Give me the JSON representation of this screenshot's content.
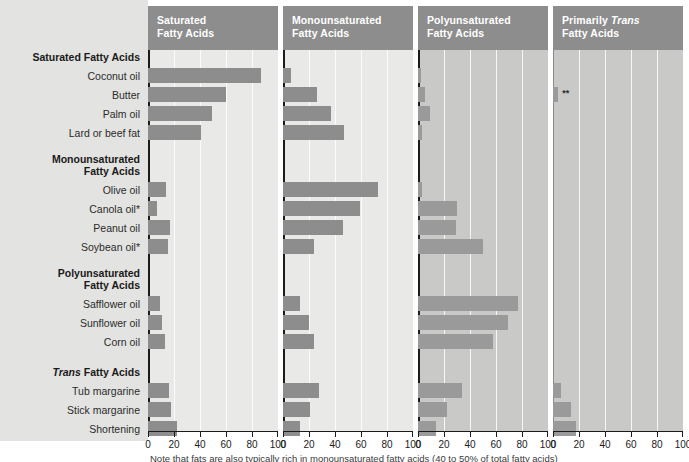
{
  "footnote": "Note that fats are also typically rich in monounsaturated fatty acids (40 to 50% of total fatty acids)",
  "axis": {
    "ticks": [
      0,
      20,
      40,
      60,
      80,
      100
    ],
    "min": 0,
    "max": 100
  },
  "panels": [
    {
      "id": "saturated",
      "line1": "Saturated",
      "line2": "Fatty Acids",
      "italic_word": ""
    },
    {
      "id": "monounsaturated",
      "line1": "Monounsaturated",
      "line2": "Fatty Acids",
      "italic_word": ""
    },
    {
      "id": "polyunsaturated",
      "line1": "Polyunsaturated",
      "line2": "Fatty Acids",
      "italic_word": ""
    },
    {
      "id": "trans",
      "line1": "Primarily ",
      "line2": "Fatty Acids",
      "italic_word": "Trans"
    }
  ],
  "rows": [
    {
      "label": "Saturated Fatty Acids",
      "type": "group",
      "italic": ""
    },
    {
      "label": "Coconut oil",
      "type": "item"
    },
    {
      "label": "Butter",
      "type": "item"
    },
    {
      "label": "Palm oil",
      "type": "item"
    },
    {
      "label": "Lard or beef fat",
      "type": "item"
    },
    {
      "label": "Monounsaturated",
      "type": "group-l1"
    },
    {
      "label": "Fatty Acids",
      "type": "group-l2"
    },
    {
      "label": "Olive oil",
      "type": "item"
    },
    {
      "label": "Canola oil*",
      "type": "item"
    },
    {
      "label": "Peanut oil",
      "type": "item"
    },
    {
      "label": "Soybean oil*",
      "type": "item"
    },
    {
      "label": "Polyunsaturated",
      "type": "group-l1"
    },
    {
      "label": "Fatty Acids",
      "type": "group-l2"
    },
    {
      "label": "Safflower oil",
      "type": "item"
    },
    {
      "label": "Sunflower oil",
      "type": "item"
    },
    {
      "label": "Corn oil",
      "type": "item"
    },
    {
      "label": "Trans Fatty Acids",
      "type": "group",
      "italic": "Trans"
    },
    {
      "label": "Tub margarine",
      "type": "item"
    },
    {
      "label": "Stick margarine",
      "type": "item"
    },
    {
      "label": "Shortening",
      "type": "item"
    }
  ],
  "chart_data": {
    "type": "bar",
    "title": "",
    "xlabel": "",
    "ylabel": "",
    "xlim": [
      0,
      100
    ],
    "grid": true,
    "legend": "none",
    "orientation": "horizontal",
    "panel_titles": [
      "Saturated Fatty Acids",
      "Monounsaturated Fatty Acids",
      "Polyunsaturated Fatty Acids",
      "Primarily Trans Fatty Acids"
    ],
    "categories": [
      "Coconut oil",
      "Butter",
      "Palm oil",
      "Lard or beef fat",
      "Olive oil",
      "Canola oil*",
      "Peanut oil",
      "Soybean oil*",
      "Safflower oil",
      "Sunflower oil",
      "Corn oil",
      "Tub margarine",
      "Stick margarine",
      "Shortening"
    ],
    "series": [
      {
        "name": "Saturated Fatty Acids",
        "values": [
          87,
          60,
          49,
          41,
          14,
          7,
          17,
          15,
          9,
          11,
          13,
          16,
          18,
          22
        ]
      },
      {
        "name": "Monounsaturated Fatty Acids",
        "values": [
          6,
          26,
          37,
          47,
          73,
          59,
          46,
          24,
          13,
          20,
          24,
          28,
          21,
          13
        ]
      },
      {
        "name": "Polyunsaturated Fatty Acids",
        "values": [
          2,
          5,
          9,
          3,
          3,
          30,
          29,
          50,
          77,
          69,
          58,
          34,
          22,
          14
        ]
      },
      {
        "name": "Primarily Trans Fatty Acids",
        "values": [
          0,
          4,
          0,
          0,
          0,
          0,
          0,
          0,
          0,
          0,
          0,
          6,
          14,
          18
        ]
      }
    ],
    "annotations": [
      {
        "series": "Primarily Trans Fatty Acids",
        "category": "Butter",
        "text": "**"
      }
    ]
  },
  "layout": {
    "row_y": [
      52,
      71,
      90,
      109,
      128,
      154,
      166,
      185,
      204,
      223,
      242,
      268,
      280,
      299,
      318,
      337,
      367,
      386,
      405,
      424
    ],
    "bar_row_y": [
      68,
      87,
      106,
      125,
      182,
      201,
      220,
      239,
      296,
      315,
      334,
      383,
      402,
      421
    ],
    "panel_x": [
      148,
      283,
      418,
      553
    ],
    "panel_dark": [
      false,
      false,
      true,
      true
    ]
  }
}
